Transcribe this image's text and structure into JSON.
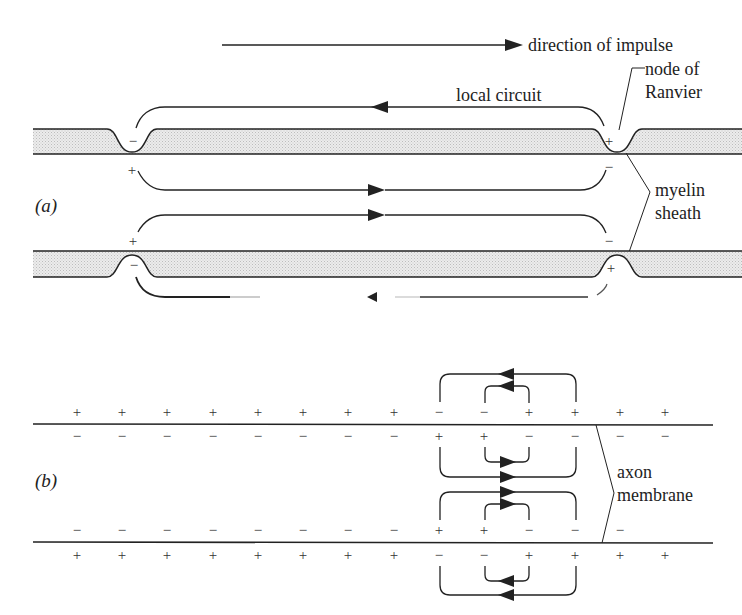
{
  "figure": {
    "panel_a": {
      "label": "(a)",
      "direction_label": "direction of impulse",
      "local_circuit_label": "local circuit",
      "node_label_line1": "node of",
      "node_label_line2": "Ranvier",
      "myelin_label_line1": "myelin",
      "myelin_label_line2": "sheath",
      "upper_fiber": {
        "left_node_charge_inside_sheath": "−",
        "left_node_charge_below": "+",
        "right_node_charge_inside_sheath": "+",
        "right_node_charge_below": "−"
      },
      "lower_fiber": {
        "left_node_charge_above": "+",
        "left_node_charge_inside_sheath": "−",
        "right_node_charge_above": "−",
        "right_node_charge_inside_sheath": "+"
      }
    },
    "panel_b": {
      "label": "(b)",
      "axon_label_line1": "axon",
      "axon_label_line2": "membrane",
      "top_membrane_outside": [
        "+",
        "+",
        "+",
        "+",
        "+",
        "+",
        "+",
        "+",
        "−",
        "−",
        "+",
        "+",
        "+",
        "+"
      ],
      "top_membrane_inside": [
        "−",
        "−",
        "−",
        "−",
        "−",
        "−",
        "−",
        "−",
        "+",
        "+",
        "−",
        "−",
        "−",
        "−"
      ],
      "bottom_membrane_inside": [
        "−",
        "−",
        "−",
        "−",
        "−",
        "−",
        "−",
        "−",
        "+",
        "+",
        "−",
        "−",
        "−",
        ""
      ],
      "bottom_membrane_outside": [
        "+",
        "+",
        "+",
        "+",
        "+",
        "+",
        "+",
        "+",
        "−",
        "−",
        "+",
        "+",
        "+",
        "+"
      ]
    }
  },
  "colors": {
    "line": "#222222",
    "sheath_fill": "#e4e4e4",
    "background": "#ffffff"
  }
}
